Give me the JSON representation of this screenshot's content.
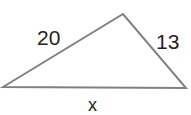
{
  "figure": {
    "type": "triangle-diagram",
    "background_color": "#ffffff",
    "stroke_color": "#808080",
    "stroke_width": 2,
    "text_color": "#232323",
    "vertices": {
      "left": {
        "x": 3,
        "y": 87
      },
      "apex": {
        "x": 123,
        "y": 14
      },
      "right": {
        "x": 186,
        "y": 88
      }
    },
    "sides": [
      {
        "name": "left-side",
        "label": "20",
        "from": "left",
        "to": "apex",
        "label_position": {
          "x": 37,
          "y": 27
        }
      },
      {
        "name": "right-side",
        "label": "13",
        "from": "apex",
        "to": "right",
        "label_position": {
          "x": 156,
          "y": 31
        }
      },
      {
        "name": "base-side",
        "label": "x",
        "from": "left",
        "to": "right",
        "label_position": {
          "x": 88,
          "y": 96
        }
      }
    ]
  }
}
